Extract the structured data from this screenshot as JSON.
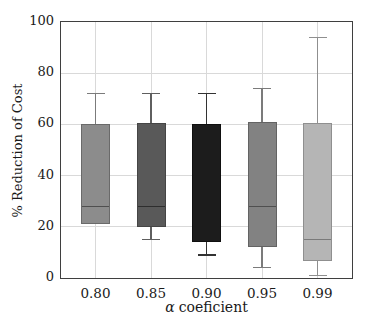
{
  "chart_data": {
    "type": "boxplot",
    "title": "",
    "ylabel": "% Reduction of Cost",
    "xlabel_symbol": "α",
    "xlabel_text": "coeficient",
    "ylim": [
      0,
      100
    ],
    "yticks": [
      0,
      20,
      40,
      60,
      80,
      100
    ],
    "grid": "both",
    "categories": [
      "0.80",
      "0.85",
      "0.90",
      "0.95",
      "0.99"
    ],
    "series": [
      {
        "category": "0.80",
        "whisker_low": null,
        "q1": 21,
        "median": 28,
        "q3": 60,
        "whisker_high": 72,
        "fill": "#8c8c8c",
        "edge": "#6a6a6a",
        "whisker_color": "#7b7b7b",
        "median_color": "#4f4f4f"
      },
      {
        "category": "0.85",
        "whisker_low": 15,
        "q1": 20,
        "median": 28,
        "q3": 60.5,
        "whisker_high": 72,
        "fill": "#595959",
        "edge": "#454545",
        "whisker_color": "#5f5f5f",
        "median_color": "#2e2e2e"
      },
      {
        "category": "0.90",
        "whisker_low": 9,
        "q1": 14,
        "median": null,
        "q3": 60,
        "whisker_high": 72,
        "fill": "#1c1c1c",
        "edge": "#0f0f0f",
        "whisker_color": "#333333",
        "median_color": null
      },
      {
        "category": "0.95",
        "whisker_low": 4,
        "q1": 12,
        "median": 28,
        "q3": 61,
        "whisker_high": 74,
        "fill": "#828282",
        "edge": "#636363",
        "whisker_color": "#7b7b7b",
        "median_color": "#4f4f4f"
      },
      {
        "category": "0.99",
        "whisker_low": 1,
        "q1": 6.5,
        "median": 15,
        "q3": 60.5,
        "whisker_high": 94,
        "fill": "#b5b5b5",
        "edge": "#8f8f8f",
        "whisker_color": "#8f8f8f",
        "median_color": "#7a7a7a"
      }
    ],
    "frame_color": "#3f3f3f",
    "gridline_color": "#d9d9d9",
    "tick_label_color": "#1a1a1a",
    "background": "#ffffff"
  }
}
